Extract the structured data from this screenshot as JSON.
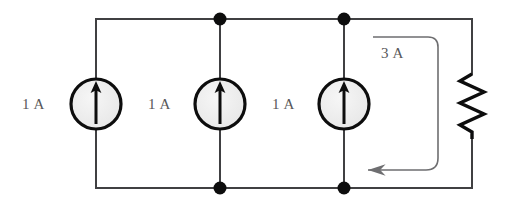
{
  "figure": {
    "background_color": "#ffffff",
    "wire_color": "#404042",
    "ink_color": "#0d0d0d",
    "label_color": "#58585a",
    "source_fill_color": "#eeeeee",
    "annotation_color": "#6e6e70"
  },
  "sources": [
    {
      "label": "1 A",
      "symbol": "current-source-up-arrow",
      "value": "1",
      "unit": "A"
    },
    {
      "label": "1 A",
      "symbol": "current-source-up-arrow",
      "value": "1",
      "unit": "A"
    },
    {
      "label": "1 A",
      "symbol": "current-source-up-arrow",
      "value": "1",
      "unit": "A"
    }
  ],
  "annotations": {
    "total_current": {
      "label": "3 A",
      "value": "3",
      "unit": "A",
      "direction": "leftward-along-bottom-rail"
    }
  },
  "components": {
    "resistor": {
      "symbol": "resistor-zigzag",
      "orientation": "vertical",
      "label": ""
    },
    "nodes": [
      {
        "name": "top-node-2"
      },
      {
        "name": "top-node-3"
      },
      {
        "name": "bottom-node-2"
      },
      {
        "name": "bottom-node-3"
      }
    ]
  }
}
